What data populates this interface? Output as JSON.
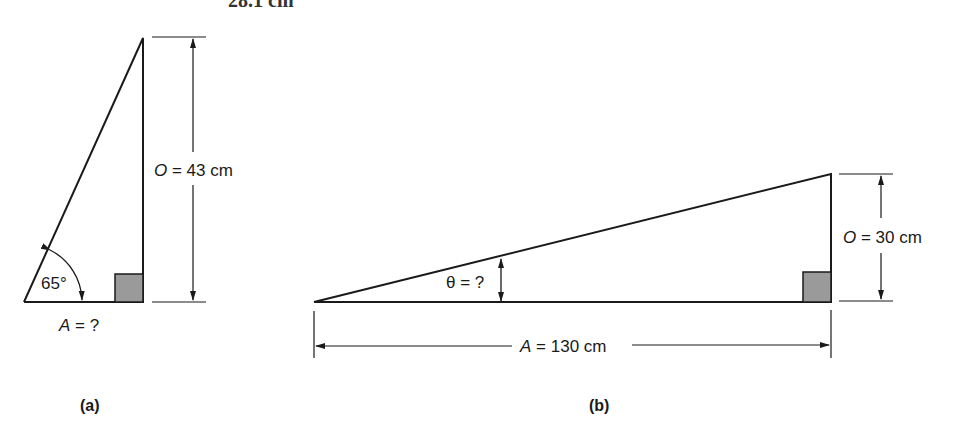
{
  "top_fragment": {
    "text": "28.1 cm"
  },
  "figure_a": {
    "caption": "(a)",
    "angle_label": "65°",
    "opposite_var": "O",
    "opposite_rest": " = 43 cm",
    "adjacent_var": "A",
    "adjacent_rest": " = ?"
  },
  "figure_b": {
    "caption": "(b)",
    "angle_label": "θ = ?",
    "opposite_var": "O",
    "opposite_rest": " = 30 cm",
    "adjacent_var": "A",
    "adjacent_rest": " = 130 cm"
  },
  "colors": {
    "line": "#1a1a1a",
    "right_angle_fill": "#9a9a9a"
  }
}
